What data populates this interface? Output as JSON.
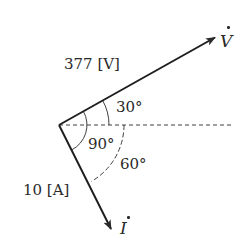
{
  "diagram": {
    "type": "phasor-diagram",
    "origin": {
      "x": 59,
      "y": 125
    },
    "reference_line": {
      "style": "dashed",
      "x_end": 232
    },
    "vectors": [
      {
        "id": "V",
        "symbol": "V",
        "dotted": true,
        "magnitude_label": "377 [V]",
        "angle_deg": 30,
        "direction": "leading",
        "tip": {
          "x": 216,
          "y": 37
        }
      },
      {
        "id": "I",
        "symbol": "I",
        "dotted": true,
        "magnitude_label": "10 [A]",
        "angle_deg": -60,
        "direction": "lagging",
        "tip": {
          "x": 112,
          "y": 230
        }
      }
    ],
    "angles": [
      {
        "label": "30°",
        "between": [
          "reference",
          "V"
        ]
      },
      {
        "label": "60°",
        "between": [
          "reference",
          "I"
        ]
      },
      {
        "label": "90°",
        "between": [
          "V",
          "I"
        ]
      }
    ],
    "colors": {
      "ink": "#2a2a2a",
      "background": "#ffffff"
    }
  },
  "labels": {
    "v_magnitude": "377 [V]",
    "i_magnitude": "10 [A]",
    "v_symbol": "V",
    "i_symbol": "I",
    "angle_30": "30°",
    "angle_60": "60°",
    "angle_90": "90°"
  }
}
